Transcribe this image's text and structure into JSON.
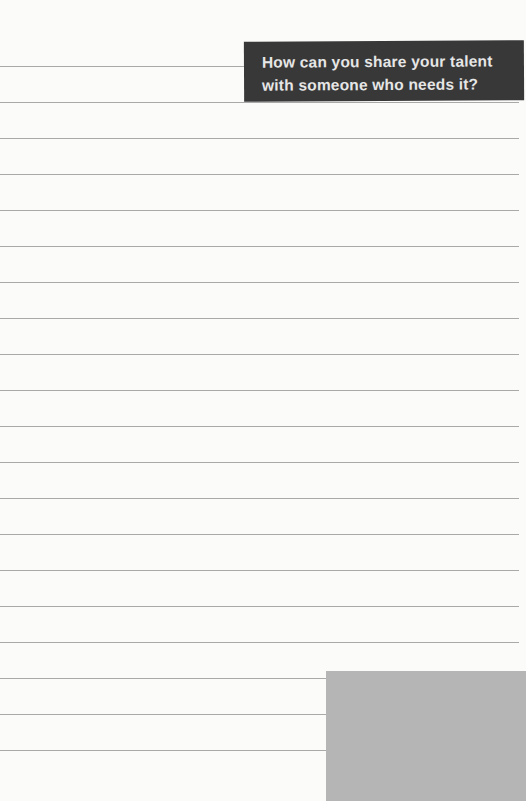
{
  "prompt": {
    "line1": "How can you share your talent",
    "line2": "with someone who needs it?"
  },
  "page": {
    "ruled_line_count": 20,
    "first_line_y": 66,
    "line_spacing": 36,
    "colors": {
      "paper": "#fbfbfa",
      "rule": "#9a9a9a",
      "banner": "#383838",
      "banner_text": "#e6e6e6",
      "block": "#b5b5b5"
    }
  }
}
